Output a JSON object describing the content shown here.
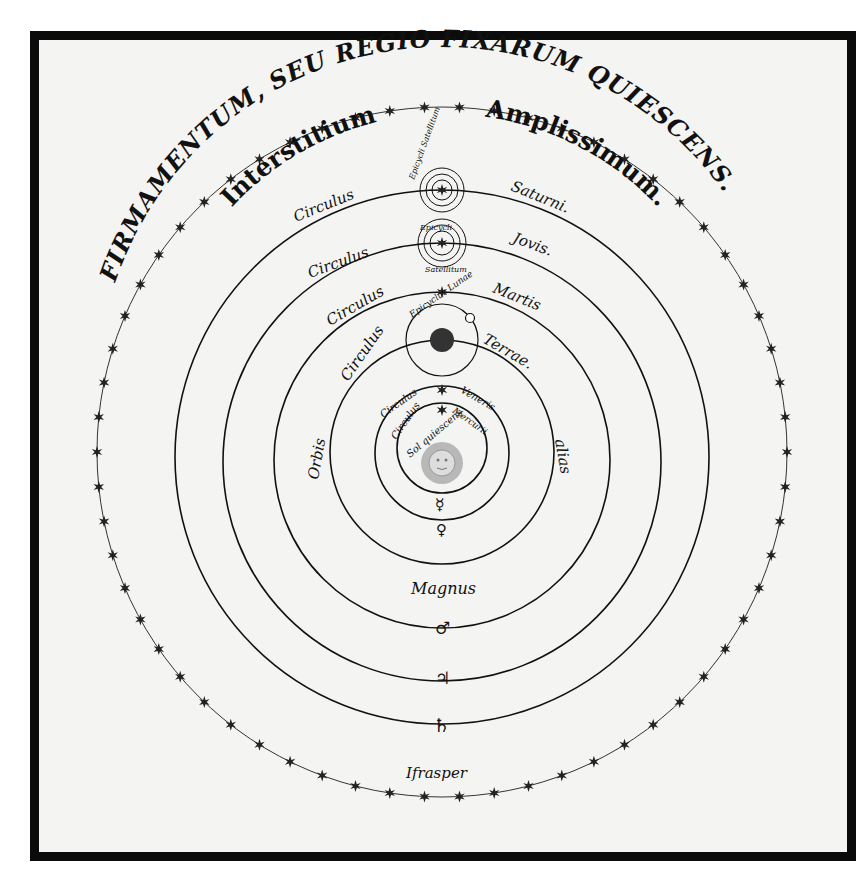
{
  "figure": {
    "outer_inscription": "FIRMAMENTUM, SEU REGIO FIXARUM QUIESCENS.",
    "interstitium": [
      "Interstitium",
      "Amplissimum."
    ],
    "orbit_labels": {
      "saturn": [
        "Circulus",
        "Saturni."
      ],
      "jupiter": [
        "Circulus",
        "Jovis."
      ],
      "mars": [
        "Circulus",
        "Martis"
      ],
      "earth": [
        "Circulus",
        "Terrae."
      ],
      "venus": [
        "Circulus",
        "Veneris"
      ],
      "mercury": [
        "Circulus",
        "Mercurii"
      ]
    },
    "epicycle_labels": {
      "saturn_satellites": "Epicycli Satellitum",
      "jupiter_satellites_top": "Epicycli",
      "jupiter_satellites_bottom": "Satellitum",
      "moon": "Epicyclus Lunae"
    },
    "sun_label": "Sol quiescens",
    "great_orb": [
      "Orbis",
      "Magnus",
      "alias"
    ],
    "bottom_label": "Ifrasper",
    "planet_symbols": {
      "mercury": "☿",
      "venus": "♀",
      "mars": "♂",
      "jupiter": "♃",
      "saturn": "♄"
    },
    "colors": {
      "ink": "#111111",
      "paper": "#f4f4f2",
      "frame": "#0b0b0b"
    }
  }
}
